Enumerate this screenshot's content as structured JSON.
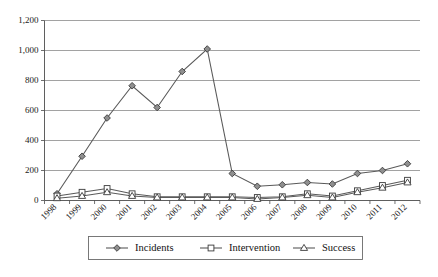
{
  "chart_data": {
    "type": "line",
    "title": "",
    "xlabel": "",
    "ylabel": "",
    "categories": [
      "1998",
      "1999",
      "2000",
      "2001",
      "2002",
      "2003",
      "2004",
      "2005",
      "2006",
      "2007",
      "2008",
      "2009",
      "2010",
      "2011",
      "2012"
    ],
    "series": [
      {
        "name": "Incidents",
        "marker": "filled-diamond",
        "color": "#8f8f8f",
        "values": [
          45,
          295,
          550,
          765,
          620,
          860,
          1010,
          180,
          95,
          105,
          120,
          110,
          180,
          200,
          245
        ]
      },
      {
        "name": "Intervention",
        "marker": "open-square",
        "color": "#ffffff",
        "values": [
          30,
          55,
          80,
          45,
          25,
          25,
          25,
          25,
          20,
          25,
          45,
          30,
          65,
          100,
          135
        ]
      },
      {
        "name": "Success",
        "marker": "open-triangle",
        "color": "#ffffff",
        "values": [
          15,
          30,
          55,
          30,
          20,
          20,
          20,
          20,
          10,
          20,
          35,
          20,
          55,
          85,
          120
        ]
      }
    ],
    "ylim": [
      0,
      1200
    ],
    "ytick_values": [
      0,
      200,
      400,
      600,
      800,
      1000,
      1200
    ],
    "ytick_labels": [
      "0",
      "200",
      "400",
      "600",
      "800",
      "1,000",
      "1,200"
    ],
    "grid": true,
    "legend_position": "bottom",
    "legend_entries": [
      "Incidents",
      "Intervention",
      "Success"
    ]
  }
}
